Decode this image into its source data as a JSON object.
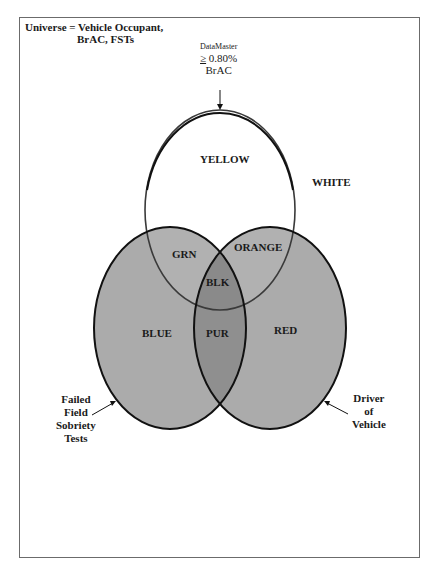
{
  "diagram": {
    "universe": {
      "line1": "Universe = Vehicle Occupant,",
      "line2": "BrAC, FSTs"
    },
    "datamaster": {
      "line1": "DataMaster",
      "ge": "≥",
      "line2": " 0.80%",
      "line3": "BrAC"
    },
    "regions": {
      "yellow": "YELLOW",
      "white": "WHITE",
      "green": "GRN",
      "orange": "ORANGE",
      "black": "BLK",
      "blue": "BLUE",
      "purple": "PUR",
      "red": "RED"
    },
    "left_label": {
      "line1": "Failed",
      "line2": "Field",
      "line3": "Sobriety",
      "line4": "Tests"
    },
    "right_label": {
      "line1": "Driver",
      "line2": "of",
      "line3": "Vehicle"
    },
    "colors": {
      "circle_fill": "#a9a9a9",
      "double_overlap": "#8e8e8e",
      "triple_overlap": "#7a7a7a",
      "outline": "#111111",
      "frame": "#6b6b6b"
    }
  }
}
